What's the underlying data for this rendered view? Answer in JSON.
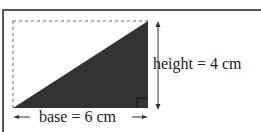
{
  "diagram": {
    "type": "right-triangle-area",
    "height_label": "height = 4 cm",
    "base_label": "base = 6 cm",
    "colors": {
      "triangle_fill": "#333333",
      "frame": "#555555",
      "dashed": "#666666"
    }
  }
}
